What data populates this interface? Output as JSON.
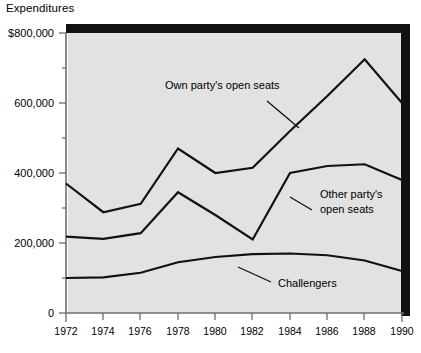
{
  "chart_data": {
    "type": "line",
    "title": "Expenditures",
    "xlabel": "",
    "ylabel": "Expenditures",
    "x": [
      1972,
      1974,
      1976,
      1978,
      1980,
      1982,
      1984,
      1986,
      1988,
      1990
    ],
    "xtick_labels": [
      "1972",
      "1974",
      "1976",
      "1978",
      "1980",
      "1982",
      "1984",
      "1986",
      "1988",
      "1990"
    ],
    "ytick_labels": [
      "0",
      "200,000",
      "400,000",
      "600,000",
      "$800,000"
    ],
    "ytick_values": [
      0,
      200000,
      400000,
      600000,
      800000
    ],
    "ylim": [
      0,
      800000
    ],
    "xlim": [
      1972,
      1990
    ],
    "grid": false,
    "legend_position": "inline-annotations",
    "series": [
      {
        "name": "Own party's open seats",
        "values": [
          370000,
          288000,
          312000,
          470000,
          400000,
          415000,
          520000,
          620000,
          725000,
          600000
        ]
      },
      {
        "name": "Other party's open seats",
        "values": [
          218000,
          212000,
          228000,
          345000,
          280000,
          210000,
          400000,
          420000,
          425000,
          380000
        ]
      },
      {
        "name": "Challengers",
        "values": [
          100000,
          102000,
          115000,
          145000,
          160000,
          168000,
          170000,
          165000,
          150000,
          120000
        ]
      }
    ],
    "annotations": [
      {
        "text": "Own party's open seats",
        "series": "Own party's open seats"
      },
      {
        "text_line1": "Other party's",
        "text_line2": "open seats",
        "series": "Other party's open seats"
      },
      {
        "text": "Challengers",
        "series": "Challengers"
      }
    ]
  },
  "labels": {
    "title": "Expenditures",
    "y0": "0",
    "y200": "200,000",
    "y400": "400,000",
    "y600": "600,000",
    "y800": "$800,000",
    "x1972": "1972",
    "x1974": "1974",
    "x1976": "1976",
    "x1978": "1978",
    "x1980": "1980",
    "x1982": "1982",
    "x1984": "1984",
    "x1986": "1986",
    "x1988": "1988",
    "x1990": "1990",
    "s1": "Own party's open seats",
    "s2a": "Other party's",
    "s2b": "open seats",
    "s3": "Challengers"
  },
  "colors": {
    "plot_background": "#e2e2e2",
    "line": "#111111",
    "axis": "#6e6e6e",
    "page_background": "#ffffff"
  }
}
